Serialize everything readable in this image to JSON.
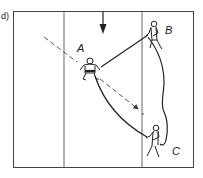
{
  "panel": {
    "label": "d)"
  },
  "players": [
    {
      "id": "A",
      "label": "A",
      "role": "center player"
    },
    {
      "id": "B",
      "label": "B",
      "role": "top-right player"
    },
    {
      "id": "C",
      "label": "C",
      "role": "bottom-right player"
    }
  ],
  "field": {
    "lane_lines": 2,
    "line_color": "#333333",
    "background": "#ffffff"
  },
  "paths": [
    {
      "name": "rope-a-to-b",
      "from": "A",
      "to": "B",
      "style": "solid-straight"
    },
    {
      "name": "rope-a-to-c",
      "from": "A",
      "to": "C",
      "style": "solid-curved"
    },
    {
      "name": "rope-b-to-c",
      "from": "B",
      "to": "C",
      "style": "solid-wavy"
    },
    {
      "name": "run-path-a",
      "from": "upper-left",
      "to": "toward C",
      "style": "dashed-arrow"
    }
  ],
  "markers": [
    {
      "name": "direction-arrow",
      "direction": "down"
    }
  ]
}
